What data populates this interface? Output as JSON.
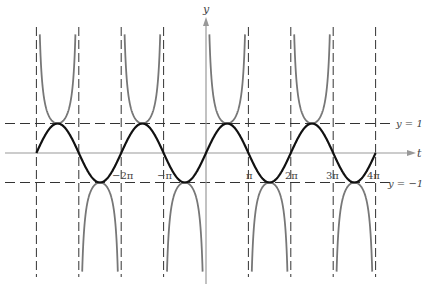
{
  "chart_data": {
    "type": "line",
    "title": "",
    "xlabel": "t",
    "ylabel": "y",
    "xlim": [
      -12.566,
      12.566
    ],
    "ylim": [
      -4.1,
      4.1
    ],
    "grid": false,
    "series": [
      {
        "name": "y = sin t",
        "function": "sin(t)",
        "color": "#111111",
        "style": "solid-thick"
      },
      {
        "name": "y = csc t",
        "function": "csc(t)",
        "color": "#777777",
        "style": "solid"
      }
    ],
    "asymptotes_vertical": [
      "-4π",
      "-3π",
      "-2π",
      "-π",
      "π",
      "2π",
      "3π",
      "4π"
    ],
    "asymptotes_horizontal": [
      {
        "y": 1,
        "label": "y = 1"
      },
      {
        "y": -1,
        "label": "y = −1"
      }
    ],
    "x_tick_labels": [
      {
        "t": -6.2832,
        "label": "−2π"
      },
      {
        "t": -3.1416,
        "label": "−π"
      },
      {
        "t": 3.1416,
        "label": "π"
      },
      {
        "t": 6.2832,
        "label": "2π"
      },
      {
        "t": 9.4248,
        "label": "3π"
      },
      {
        "t": 12.5664,
        "label": "4π"
      }
    ]
  },
  "labels": {
    "y_axis": "y",
    "t_axis": "t",
    "y_eq_1": "y = 1",
    "y_eq_neg1": "y = −1",
    "neg2pi": "−2π",
    "negpi": "−π",
    "pi": "π",
    "twopi": "2π",
    "threepi": "3π",
    "fourpi": "4π"
  },
  "colors": {
    "sin": "#111111",
    "csc": "#777777",
    "dashed": "#333333",
    "axis": "#999999"
  }
}
